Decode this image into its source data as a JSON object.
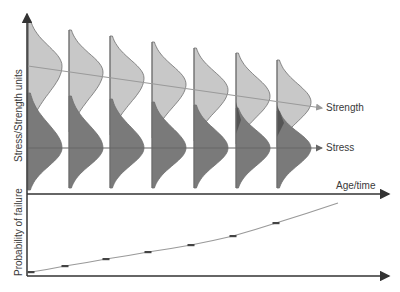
{
  "labels": {
    "y_top": "Stress/Strength units",
    "y_bottom": "Probability of failure",
    "x_axis": "Age/time",
    "strength": "Strength",
    "stress": "Stress"
  },
  "colors": {
    "axis": "#333333",
    "strength_fill": "#c8c8c8",
    "stress_fill": "#7a7a7a",
    "overlap_fill": "#555555",
    "outline": "#6e6e6e",
    "trend_line": "#9a9a9a",
    "stress_line": "#666666",
    "marker": "#444444"
  },
  "chart_data": {
    "type": "diagram",
    "columns": [
      {
        "x": 28,
        "top": 20,
        "strength_peak_y": 66,
        "strength_width": 34,
        "stress_peak_y": 148,
        "stress_width": 34,
        "bottom": 190
      },
      {
        "x": 69,
        "top": 30,
        "strength_peak_y": 72,
        "strength_width": 34,
        "stress_peak_y": 148,
        "stress_width": 34,
        "bottom": 188
      },
      {
        "x": 110,
        "top": 36,
        "strength_peak_y": 78,
        "strength_width": 34,
        "stress_peak_y": 148,
        "stress_width": 34,
        "bottom": 188
      },
      {
        "x": 152,
        "top": 42,
        "strength_peak_y": 84,
        "strength_width": 34,
        "stress_peak_y": 148,
        "stress_width": 34,
        "bottom": 188
      },
      {
        "x": 194,
        "top": 48,
        "strength_peak_y": 90,
        "strength_width": 34,
        "stress_peak_y": 148,
        "stress_width": 34,
        "bottom": 188
      },
      {
        "x": 236,
        "top": 53,
        "strength_peak_y": 96,
        "strength_width": 34,
        "stress_peak_y": 148,
        "stress_width": 34,
        "bottom": 188
      },
      {
        "x": 277,
        "top": 60,
        "strength_peak_y": 102,
        "strength_width": 34,
        "stress_peak_y": 148,
        "stress_width": 34,
        "bottom": 188
      }
    ],
    "strength_trend": {
      "x1": 28,
      "y1": 66,
      "x2": 322,
      "y2": 108
    },
    "stress_trend": {
      "x1": 28,
      "y1": 148,
      "x2": 322,
      "y2": 148
    },
    "failure_probability_points": [
      {
        "x": 31,
        "y": 272
      },
      {
        "x": 65,
        "y": 266
      },
      {
        "x": 106,
        "y": 259
      },
      {
        "x": 148,
        "y": 252
      },
      {
        "x": 191,
        "y": 245
      },
      {
        "x": 233,
        "y": 236
      },
      {
        "x": 276,
        "y": 223
      }
    ],
    "failure_curve_end": {
      "x": 338,
      "y": 203
    },
    "axes": {
      "y_axis_x": 27,
      "y_axis_top": 14,
      "y_axis_bottom": 276,
      "mid_axis_y": 194,
      "bottom_axis_y": 276,
      "x_axis_end": 389
    }
  }
}
